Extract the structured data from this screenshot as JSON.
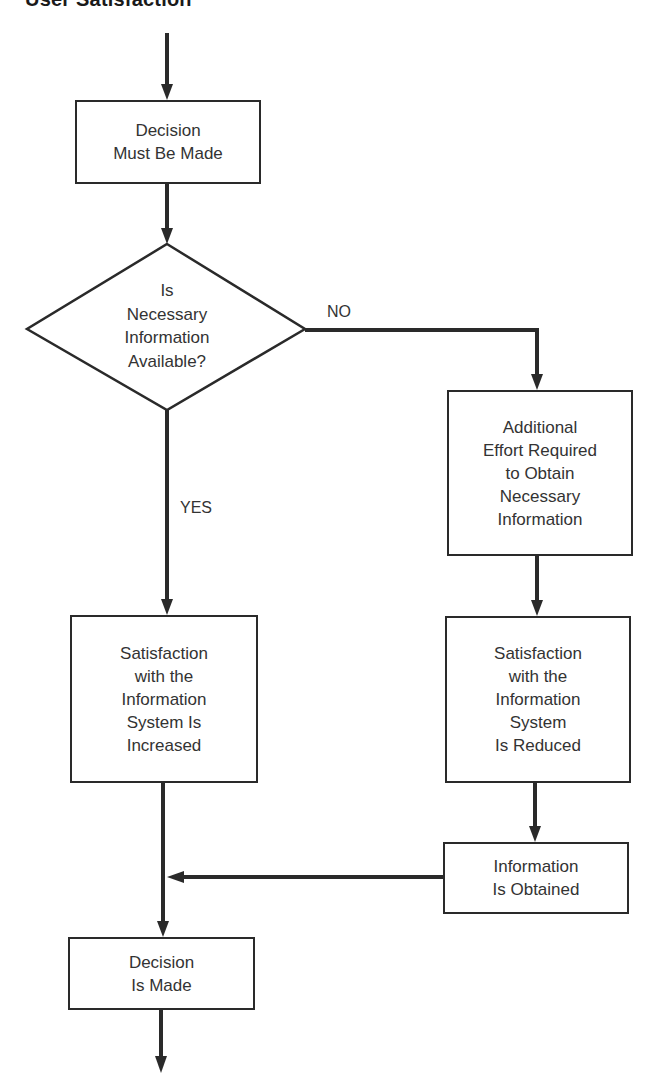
{
  "title": "User Satisfaction",
  "nodes": {
    "start_box": {
      "text": "Decision\nMust Be Made"
    },
    "decision": {
      "text": "Is\nNecessary\nInformation\nAvailable?"
    },
    "effort_box": {
      "text": "Additional\nEffort Required\nto Obtain\nNecessary\nInformation"
    },
    "increased_box": {
      "text": "Satisfaction\nwith the\nInformation\nSystem Is\nIncreased"
    },
    "reduced_box": {
      "text": "Satisfaction\nwith the\nInformation\nSystem\nIs Reduced"
    },
    "obtained_box": {
      "text": "Information\nIs Obtained"
    },
    "end_box": {
      "text": "Decision\nIs Made"
    }
  },
  "edge_labels": {
    "no": "NO",
    "yes": "YES"
  },
  "colors": {
    "line": "#2a2a2a",
    "background": "#ffffff"
  }
}
